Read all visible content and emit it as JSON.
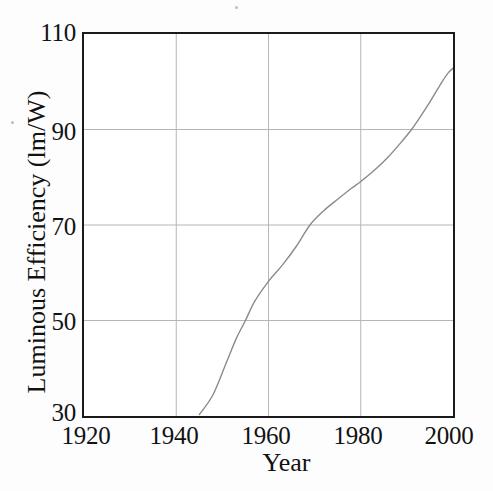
{
  "chart_data": {
    "type": "line",
    "title": "",
    "xlabel": "Year",
    "ylabel": "Luminous Efficiency (lm/W)",
    "xlim": [
      1920,
      2000
    ],
    "ylim": [
      30,
      110
    ],
    "xticks": [
      1920,
      1940,
      1960,
      1980,
      2000
    ],
    "yticks": [
      30,
      50,
      70,
      90,
      110
    ],
    "xtick_labels": [
      "1920",
      "1940",
      "1960",
      "1980",
      "2000"
    ],
    "ytick_labels": [
      "30",
      "50",
      "70",
      "90",
      "110"
    ],
    "grid": true,
    "legend": null,
    "line_color": "#8a8a8a",
    "frame_color": "#1a1a1a",
    "grid_color": "#b4b4b4",
    "background": "#ffffff",
    "series": [
      {
        "name": "Luminous efficiency of lamps",
        "x": [
          1945,
          1948,
          1951,
          1953,
          1955,
          1957,
          1960,
          1963,
          1966,
          1969,
          1972,
          1975,
          1978,
          1980,
          1983,
          1986,
          1989,
          1991,
          1993,
          1995,
          1997,
          1999,
          2001
        ],
        "y": [
          30.3,
          34.5,
          41.5,
          46.2,
          50.0,
          54.0,
          58.2,
          61.6,
          65.5,
          70.0,
          73.0,
          75.4,
          77.7,
          79.1,
          81.5,
          84.3,
          87.6,
          90.0,
          92.8,
          95.8,
          99.0,
          101.9,
          103.6
        ]
      }
    ]
  },
  "axes": {
    "y_tick_positions_px": [
      32,
      131,
      226,
      321,
      418
    ],
    "x_tick_positions_px": [
      82,
      174,
      266,
      358,
      450
    ]
  }
}
